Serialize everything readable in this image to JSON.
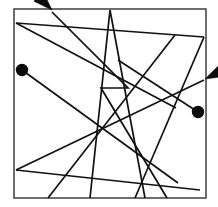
{
  "figure": {
    "title": "Tangled line segment figure",
    "description": "Square frame enclosing overlapping straight-line polylines with two filled circular endpoints and two arrowhead endpoints",
    "canvas": {
      "width": 218,
      "height": 207,
      "background_color": "#ffffff"
    },
    "frame": {
      "name": "border-square",
      "x": 14,
      "y": 9,
      "width": 192,
      "height": 189,
      "stroke_color": "#4a4a4a",
      "stroke_width": 1.6,
      "fill_color": "#ffffff"
    },
    "line_style": {
      "stroke_color": "#111111",
      "stroke_width": 1.7
    },
    "paths": [
      {
        "name": "path-upper-left-fan-a",
        "points": "16,23 204,37"
      },
      {
        "name": "path-upper-left-fan-b",
        "points": "16,23 176,108"
      },
      {
        "name": "path-top-apex-v",
        "points": "90,198 110,10 145,198"
      },
      {
        "name": "path-steep-right-descend",
        "points": "204,37 135,198"
      },
      {
        "name": "path-long-diagonal-rise",
        "points": "16,170 204,80"
      },
      {
        "name": "path-left-dot-lead",
        "points": "22,70 178,183"
      },
      {
        "name": "path-zigzag-notch",
        "points": "52,12 128,88 101,88 167,198"
      },
      {
        "name": "path-lower-left-sweep",
        "points": "16,170 200,190"
      },
      {
        "name": "path-mid-cross-steep",
        "points": "48,198 175,35"
      },
      {
        "name": "path-right-dot-lead",
        "points": "198,112 118,60"
      }
    ],
    "dots": [
      {
        "name": "endpoint-dot-left",
        "cx": 22,
        "cy": 70,
        "r": 6.2,
        "color": "#0a0a0a"
      },
      {
        "name": "endpoint-dot-right",
        "cx": 198,
        "cy": 112,
        "r": 6.2,
        "color": "#0a0a0a"
      }
    ],
    "arrows": [
      {
        "name": "arrowhead-up-left",
        "tip_x": 52,
        "tip_y": 10,
        "angle_deg": 225,
        "length": 19,
        "half_width": 6.5,
        "color": "#0a0a0a"
      },
      {
        "name": "arrowhead-up-right",
        "tip_x": 205,
        "tip_y": 79,
        "angle_deg": 334,
        "length": 18,
        "half_width": 6,
        "color": "#0a0a0a"
      }
    ]
  }
}
